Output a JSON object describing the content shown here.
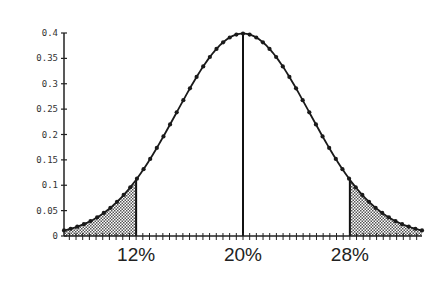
{
  "chart_data": {
    "type": "area",
    "title": "",
    "xlabel": "",
    "ylabel": "",
    "mean": 20,
    "sd": 5,
    "xlim": [
      6.6,
      33.4
    ],
    "ylim": [
      0,
      0.4
    ],
    "yticks": [
      0,
      0.05,
      0.1,
      0.15,
      0.2,
      0.25,
      0.3,
      0.35,
      0.4
    ],
    "ytick_labels": [
      "0",
      "0.05",
      "0.1",
      "0.15",
      "0.2",
      "0.25",
      "0.3",
      "0.35",
      "0.4"
    ],
    "xtick_labels": [
      {
        "value": 12,
        "label": "12%"
      },
      {
        "value": 20,
        "label": "20%"
      },
      {
        "value": 28,
        "label": "28%"
      }
    ],
    "vertical_lines": [
      12,
      20,
      28
    ],
    "shaded_regions": [
      {
        "from": 6.6,
        "to": 12,
        "pattern": "dotted"
      },
      {
        "from": 28,
        "to": 33.4,
        "pattern": "dotted"
      }
    ],
    "peak_density": 0.399,
    "grid": false,
    "legend": null,
    "series": [
      {
        "name": "density",
        "marker": "dot",
        "color": "#1a1a1a"
      }
    ]
  }
}
